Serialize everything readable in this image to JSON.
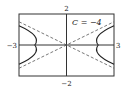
{
  "diagram": {
    "type": "hyperbola-graph",
    "window": {
      "xmin": -3,
      "xmax": 3,
      "ymin": -2,
      "ymax": 2
    },
    "labels": {
      "ymax": "2",
      "ymin": "−2",
      "xmin": "−3",
      "xmax": "3",
      "curve": "C = −4"
    },
    "curve": {
      "equation": "x^2 - 4y^2 = 4",
      "constant": -4,
      "branches": [
        "left",
        "right"
      ],
      "color": "#222222"
    },
    "asymptotes": {
      "slopes": [
        0.5,
        -0.5
      ],
      "style": "dashed",
      "color": "#444444"
    },
    "frame_color": "#333333",
    "background": "#ffffff"
  }
}
